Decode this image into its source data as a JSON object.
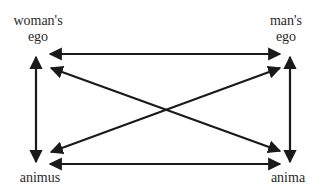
{
  "diagram": {
    "nodes": [
      {
        "id": "womans-ego",
        "line1": "woman's",
        "line2": "ego"
      },
      {
        "id": "mans-ego",
        "line1": "man's",
        "line2": "ego"
      },
      {
        "id": "animus",
        "line1": "animus"
      },
      {
        "id": "anima",
        "line1": "anima"
      }
    ],
    "edges": [
      {
        "from": "womans-ego",
        "to": "mans-ego",
        "type": "bidirectional"
      },
      {
        "from": "animus",
        "to": "anima",
        "type": "bidirectional"
      },
      {
        "from": "womans-ego",
        "to": "animus",
        "type": "bidirectional"
      },
      {
        "from": "mans-ego",
        "to": "anima",
        "type": "bidirectional"
      },
      {
        "from": "womans-ego",
        "to": "anima",
        "type": "bidirectional"
      },
      {
        "from": "animus",
        "to": "mans-ego",
        "type": "bidirectional"
      }
    ],
    "colors": {
      "stroke": "#1a1a1a",
      "background": "#ffffff"
    }
  }
}
